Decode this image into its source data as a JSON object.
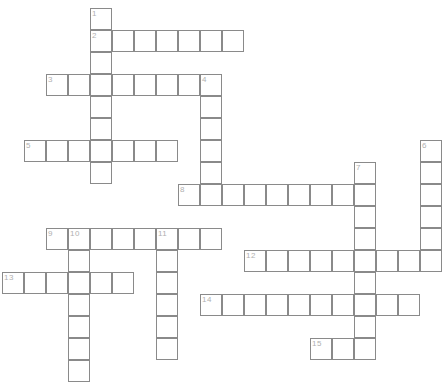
{
  "puzzle": {
    "type": "crossword-grid",
    "title": "",
    "cell_size": 22,
    "grid_origin": {
      "x": 2,
      "y": 8
    },
    "colors": {
      "cell_border": "#8a8a8a",
      "cell_fill": "#ffffff",
      "number_text": "#b0b0b0",
      "background": "#ffffff"
    },
    "entries": [
      {
        "number": "1",
        "direction": "down",
        "col": 4,
        "row": 0,
        "length": 8
      },
      {
        "number": "2",
        "direction": "across",
        "col": 4,
        "row": 1,
        "length": 7
      },
      {
        "number": "3",
        "direction": "across",
        "col": 2,
        "row": 3,
        "length": 8
      },
      {
        "number": "4",
        "direction": "down",
        "col": 9,
        "row": 3,
        "length": 6
      },
      {
        "number": "5",
        "direction": "across",
        "col": 1,
        "row": 6,
        "length": 7
      },
      {
        "number": "6",
        "direction": "down",
        "col": 19,
        "row": 6,
        "length": 6
      },
      {
        "number": "7",
        "direction": "down",
        "col": 16,
        "row": 7,
        "length": 9
      },
      {
        "number": "8",
        "direction": "across",
        "col": 8,
        "row": 8,
        "length": 9
      },
      {
        "number": "9",
        "direction": "across",
        "col": 2,
        "row": 10,
        "length": 8
      },
      {
        "number": "10",
        "direction": "down",
        "col": 3,
        "row": 10,
        "length": 7
      },
      {
        "number": "11",
        "direction": "down",
        "col": 7,
        "row": 10,
        "length": 6
      },
      {
        "number": "12",
        "direction": "across",
        "col": 11,
        "row": 11,
        "length": 8
      },
      {
        "number": "13",
        "direction": "across",
        "col": 0,
        "row": 12,
        "length": 6
      },
      {
        "number": "14",
        "direction": "across",
        "col": 9,
        "row": 13,
        "length": 10
      },
      {
        "number": "15",
        "direction": "across",
        "col": 14,
        "row": 15,
        "length": 3
      }
    ],
    "numbered_cells": [
      {
        "number": "1",
        "col": 4,
        "row": 0
      },
      {
        "number": "2",
        "col": 4,
        "row": 1
      },
      {
        "number": "3",
        "col": 2,
        "row": 3
      },
      {
        "number": "4",
        "col": 9,
        "row": 3
      },
      {
        "number": "5",
        "col": 1,
        "row": 6
      },
      {
        "number": "6",
        "col": 19,
        "row": 6
      },
      {
        "number": "7",
        "col": 16,
        "row": 7
      },
      {
        "number": "8",
        "col": 8,
        "row": 8
      },
      {
        "number": "9",
        "col": 2,
        "row": 10
      },
      {
        "number": "10",
        "col": 3,
        "row": 10
      },
      {
        "number": "11",
        "col": 7,
        "row": 10
      },
      {
        "number": "12",
        "col": 11,
        "row": 11
      },
      {
        "number": "13",
        "col": 0,
        "row": 12
      },
      {
        "number": "14",
        "col": 9,
        "row": 13
      },
      {
        "number": "15",
        "col": 14,
        "row": 15
      }
    ],
    "letters": []
  }
}
